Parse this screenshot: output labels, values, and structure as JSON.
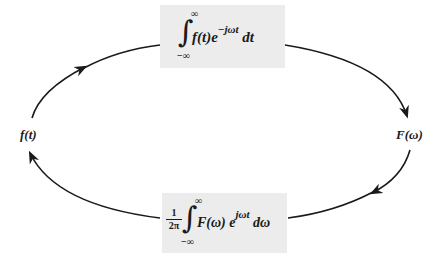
{
  "diagram": {
    "type": "cycle",
    "nodes": {
      "left": {
        "label": "f(t)"
      },
      "right": {
        "label": "F(ω)"
      }
    },
    "edges": {
      "forward": {
        "from": "f(t)",
        "to": "F(ω)",
        "direction": "clockwise-top",
        "formula": {
          "integral_upper": "∞",
          "integral_lower": "−∞",
          "integrand": "f(t)e",
          "exponent": "−jωt",
          "differential": "dt",
          "text": "∫_{−∞}^{∞} f(t) e^{−jωt} dt"
        }
      },
      "inverse": {
        "from": "F(ω)",
        "to": "f(t)",
        "direction": "clockwise-bottom",
        "formula": {
          "coefficient_num": "1",
          "coefficient_den": "2π",
          "integral_upper": "∞",
          "integral_lower": "−∞",
          "integrand": "F(ω) e",
          "exponent": "jωt",
          "differential": "dω",
          "text": "(1/2π) ∫_{−∞}^{∞} F(ω) e^{jωt} dω"
        }
      }
    },
    "colors": {
      "line": "#1a1a1a",
      "box_fill": "#ececec",
      "background": "#ffffff"
    }
  }
}
